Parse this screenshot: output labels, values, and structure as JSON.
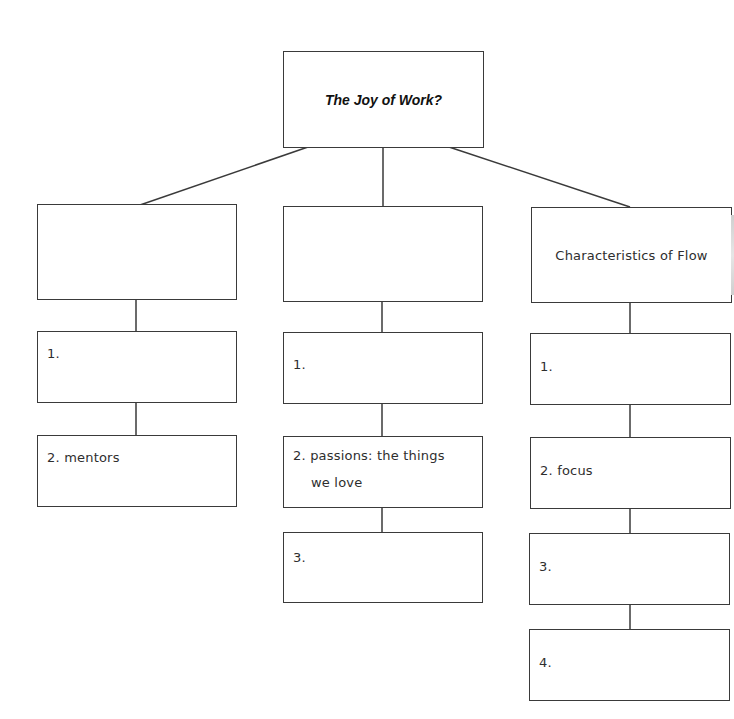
{
  "diagram": {
    "title": "The Joy of Work?",
    "columns": [
      {
        "heading": "",
        "items": [
          "1.",
          "2. mentors"
        ]
      },
      {
        "heading": "",
        "items": [
          "1.",
          "2. passions: the things",
          "3."
        ],
        "items_continuation": {
          "1": "we love"
        }
      },
      {
        "heading": "Characteristics of Flow",
        "items": [
          "1.",
          "2. focus",
          "3.",
          "4."
        ]
      }
    ]
  },
  "colors": {
    "line": "#3a3a3a",
    "background": "#ffffff",
    "text": "#2e2e2e"
  }
}
